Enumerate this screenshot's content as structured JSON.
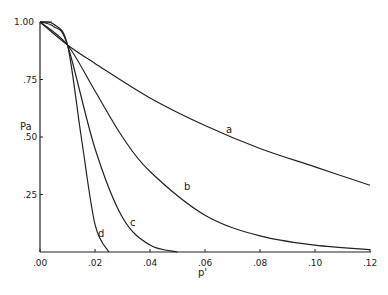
{
  "chart_data": {
    "type": "line",
    "title": "",
    "xlabel": "p'",
    "ylabel": "Pa",
    "xlim": [
      0,
      0.12
    ],
    "ylim": [
      0,
      1.0
    ],
    "x_ticks": [
      ".00",
      ".02",
      ".04",
      ".06",
      ".08",
      ".10",
      ".12"
    ],
    "y_ticks": [
      ".25",
      ".50",
      ".75",
      "1.00"
    ],
    "grid": false,
    "series": [
      {
        "name": "a",
        "x": [
          0,
          0.01,
          0.02,
          0.04,
          0.06,
          0.08,
          0.1,
          0.12
        ],
        "values": [
          1.0,
          0.9,
          0.82,
          0.67,
          0.55,
          0.45,
          0.37,
          0.29
        ]
      },
      {
        "name": "b",
        "x": [
          0,
          0.01,
          0.02,
          0.03,
          0.04,
          0.06,
          0.08,
          0.1,
          0.12
        ],
        "values": [
          1.0,
          0.9,
          0.7,
          0.5,
          0.35,
          0.16,
          0.07,
          0.03,
          0.01
        ]
      },
      {
        "name": "c",
        "x": [
          0,
          0.005,
          0.01,
          0.02,
          0.03,
          0.04,
          0.05
        ],
        "values": [
          1.0,
          0.98,
          0.9,
          0.45,
          0.15,
          0.03,
          0.0
        ]
      },
      {
        "name": "d",
        "x": [
          0,
          0.005,
          0.01,
          0.015,
          0.02,
          0.025
        ],
        "values": [
          1.0,
          0.99,
          0.9,
          0.5,
          0.12,
          0.0
        ]
      }
    ]
  }
}
